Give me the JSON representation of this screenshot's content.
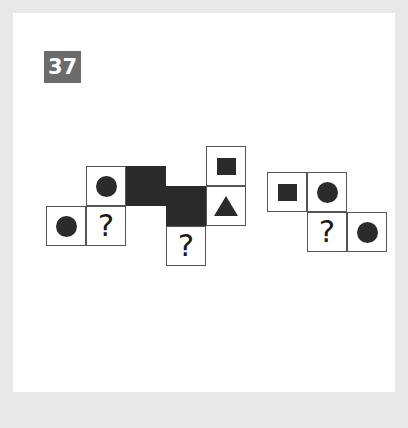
{
  "puzzle": {
    "number_badge": "37",
    "question_mark": "?",
    "badge_color": "#6b6b6b",
    "shape_color": "#2b2b2b",
    "cell_border_color": "#555555",
    "card_background": "#ffffff",
    "page_background": "#e8e8e8",
    "cell_size_px": 40,
    "figures": [
      {
        "name": "figure-left",
        "origin": {
          "x": 46,
          "y": 166
        },
        "cells": [
          {
            "col": 1,
            "row": 0,
            "content": "circle"
          },
          {
            "col": 2,
            "row": 0,
            "content": "solid"
          },
          {
            "col": 0,
            "row": 1,
            "content": "circle"
          },
          {
            "col": 1,
            "row": 1,
            "content": "question"
          }
        ]
      },
      {
        "name": "figure-middle",
        "origin": {
          "x": 166,
          "y": 146
        },
        "cells": [
          {
            "col": 1,
            "row": 0,
            "content": "square"
          },
          {
            "col": 0,
            "row": 1,
            "content": "solid"
          },
          {
            "col": 1,
            "row": 1,
            "content": "triangle"
          },
          {
            "col": 0,
            "row": 2,
            "content": "question"
          }
        ]
      },
      {
        "name": "figure-right",
        "origin": {
          "x": 267,
          "y": 172
        },
        "cells": [
          {
            "col": 0,
            "row": 0,
            "content": "square"
          },
          {
            "col": 1,
            "row": 0,
            "content": "circle"
          },
          {
            "col": 1,
            "row": 1,
            "content": "question"
          },
          {
            "col": 2,
            "row": 1,
            "content": "circle"
          }
        ]
      }
    ]
  }
}
